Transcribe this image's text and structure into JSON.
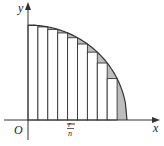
{
  "diagram": {
    "labels": {
      "y_axis": "y",
      "x_axis": "x",
      "origin": "O",
      "strip_width_num": "r",
      "strip_width_den": "n"
    },
    "num_rectangles": 10,
    "colors": {
      "line": "#333333",
      "shade": "#bdbdbd",
      "background": "#ffffff"
    }
  }
}
